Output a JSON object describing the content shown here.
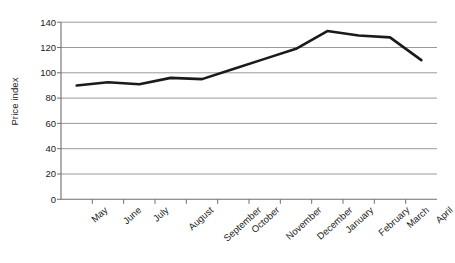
{
  "chart_data": {
    "type": "line",
    "title": "",
    "xlabel": "",
    "ylabel": "Price index",
    "categories": [
      "May",
      "June",
      "July",
      "August",
      "September",
      "October",
      "November",
      "December",
      "January",
      "February",
      "March",
      "April"
    ],
    "values": [
      90,
      92.5,
      91,
      96,
      95,
      103,
      111,
      119,
      133,
      129.5,
      128,
      110
    ],
    "series": [
      {
        "name": "Price index",
        "values": [
          90,
          92.5,
          91,
          96,
          95,
          103,
          111,
          119,
          133,
          129.5,
          128,
          110
        ]
      }
    ],
    "ylim": [
      0,
      140
    ],
    "yticks": [
      0,
      20,
      40,
      60,
      80,
      100,
      120,
      140
    ],
    "ytick_labels": [
      "0",
      "20",
      "40",
      "60",
      "80",
      "100",
      "120",
      "140"
    ],
    "grid": "horizontal",
    "legend": "none",
    "line_color": "#1a1a1a",
    "grid_color": "#9a9a9a",
    "axis_color": "#6e6e6e",
    "background": "#ffffff"
  }
}
